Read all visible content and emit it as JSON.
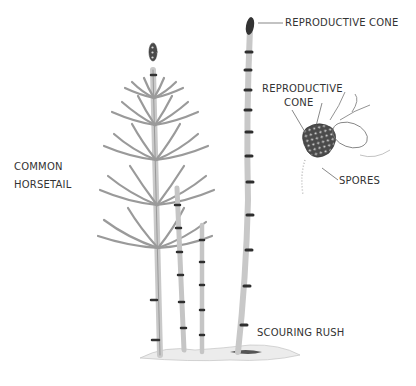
{
  "figure": {
    "plants": [
      {
        "id": "common-horsetail",
        "name_lines": [
          "COMMON",
          "HORSETAIL"
        ]
      },
      {
        "id": "scouring-rush",
        "name": "SCOURING RUSH"
      }
    ],
    "labels": {
      "reproductive_cone_top": "REPRODUCTIVE CONE",
      "reproductive_cone_detail_line1": "REPRODUCTIVE",
      "reproductive_cone_detail_line2": "CONE",
      "spores": "SPORES",
      "common_horsetail_line1": "COMMON",
      "common_horsetail_line2": "HORSETAIL",
      "scouring_rush": "SCOURING RUSH"
    },
    "colors": {
      "stem": "#b8b8b8",
      "stem_outline": "#6a6a6a",
      "node_band": "#2e2e2e",
      "cone": "#3a3a3a",
      "label_text": "#333333",
      "leader_line": "#555555"
    }
  }
}
